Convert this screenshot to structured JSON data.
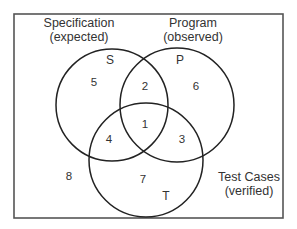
{
  "diagram": {
    "type": "venn",
    "colors": {
      "frame": "#555555",
      "circle_stroke": "#222222",
      "text": "#333333",
      "background": "#ffffff"
    },
    "sets": [
      {
        "id": "S",
        "letter": "S",
        "caption_line1": "Specification",
        "caption_line2": "(expected)",
        "cx": 112,
        "cy": 105,
        "r": 56
      },
      {
        "id": "P",
        "letter": "P",
        "caption_line1": "Program",
        "caption_line2": "(observed)",
        "cx": 177,
        "cy": 105,
        "r": 57
      },
      {
        "id": "T",
        "letter": "T",
        "caption_line1": "Test Cases",
        "caption_line2": "(verified)",
        "cx": 146,
        "cy": 160,
        "r": 57
      }
    ],
    "regions": [
      {
        "label": "1",
        "membership": [
          "S",
          "P",
          "T"
        ],
        "x": 145,
        "y": 128
      },
      {
        "label": "2",
        "membership": [
          "S",
          "P"
        ],
        "x": 145,
        "y": 90
      },
      {
        "label": "3",
        "membership": [
          "P",
          "T"
        ],
        "x": 182,
        "y": 143
      },
      {
        "label": "4",
        "membership": [
          "S",
          "T"
        ],
        "x": 109,
        "y": 143
      },
      {
        "label": "5",
        "membership": [
          "S"
        ],
        "x": 94,
        "y": 86
      },
      {
        "label": "6",
        "membership": [
          "P"
        ],
        "x": 196,
        "y": 90
      },
      {
        "label": "7",
        "membership": [
          "T"
        ],
        "x": 143,
        "y": 183
      },
      {
        "label": "8",
        "membership": [],
        "x": 69,
        "y": 180
      }
    ]
  }
}
